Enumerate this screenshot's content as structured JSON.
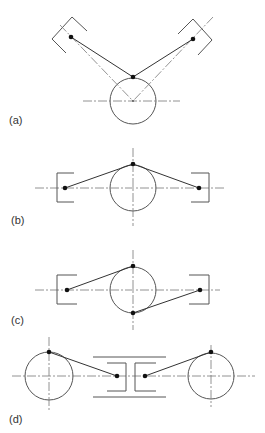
{
  "figure": {
    "panels": [
      {
        "id": "a",
        "label": "(a)",
        "description": "Pulley with two angled bearing pivots above, links meeting at top of circle"
      },
      {
        "id": "b",
        "label": "(b)",
        "description": "Pulley with two horizontal bearing pivots, links meeting at top of circle"
      },
      {
        "id": "c",
        "label": "(c)",
        "description": "Pulley with two horizontal pivots, links attached at top and bottom of circle"
      },
      {
        "id": "d",
        "label": "(d)",
        "description": "Two pulleys with central housing containing two pivots, links to top of each pulley"
      }
    ],
    "colors": {
      "line": "#555555",
      "belt": "#333333",
      "centerline": "#777777",
      "dot": "#111111",
      "background": "#ffffff"
    }
  }
}
